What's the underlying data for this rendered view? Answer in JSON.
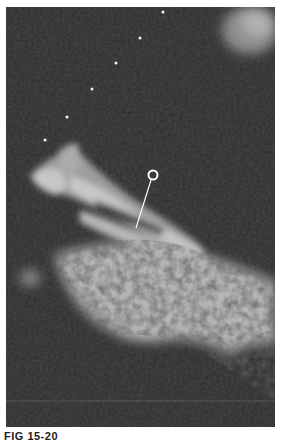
{
  "figure": {
    "type": "ultrasound-scan",
    "background_color": "#2d2d2d",
    "tissue_color": "#d8d8d8",
    "marker": {
      "shape": "circle-with-leader-line",
      "circle_center": [
        153,
        175
      ],
      "line_end": [
        136,
        228
      ],
      "color": "#ffffff"
    },
    "depth_markers": [
      [
        163,
        12
      ],
      [
        140,
        38
      ],
      [
        116,
        63
      ],
      [
        92,
        89
      ],
      [
        67,
        117
      ],
      [
        45,
        140
      ]
    ]
  },
  "caption": {
    "label": "FIG 15-20"
  }
}
